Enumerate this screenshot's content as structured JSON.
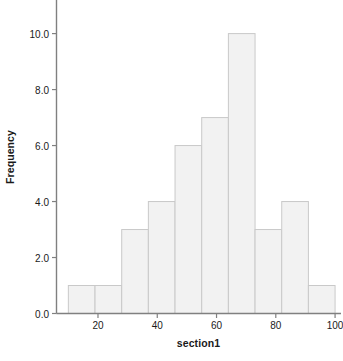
{
  "chart_data": {
    "type": "bar",
    "title": "",
    "subtitle": "",
    "xlabel": "section1",
    "ylabel": "Frequency",
    "categories": [
      "10-19",
      "19-28",
      "28-37",
      "37-46",
      "46-55",
      "55-64",
      "64-73",
      "73-82",
      "82-91",
      "91-100"
    ],
    "bin_edges": [
      10,
      19,
      28,
      37,
      46,
      55,
      64,
      73,
      82,
      91,
      100
    ],
    "values": [
      1,
      1,
      3,
      4,
      6,
      7,
      10,
      3,
      4,
      1
    ],
    "x": [
      14.5,
      23.5,
      32.5,
      41.5,
      50.5,
      59.5,
      68.5,
      77.5,
      86.5,
      95.5
    ],
    "xlim": [
      6,
      102
    ],
    "ylim": [
      0,
      11.2
    ],
    "x_ticks": [
      20,
      40,
      60,
      80,
      100
    ],
    "x_tick_labels": [
      "20",
      "40",
      "60",
      "80",
      "100"
    ],
    "y_ticks": [
      0,
      2,
      4,
      6,
      8,
      10
    ],
    "y_tick_labels": [
      "0.0",
      "2.0",
      "4.0",
      "6.0",
      "8.0",
      "10.0"
    ],
    "grid": false,
    "legend": false,
    "legend_position": "none",
    "bar_fill_color": "#f2f2f2",
    "bar_border_color": "#c9c9c9",
    "axis_color": "#808080",
    "text_color": "#1a1a1a",
    "background_color": "#ffffff"
  }
}
